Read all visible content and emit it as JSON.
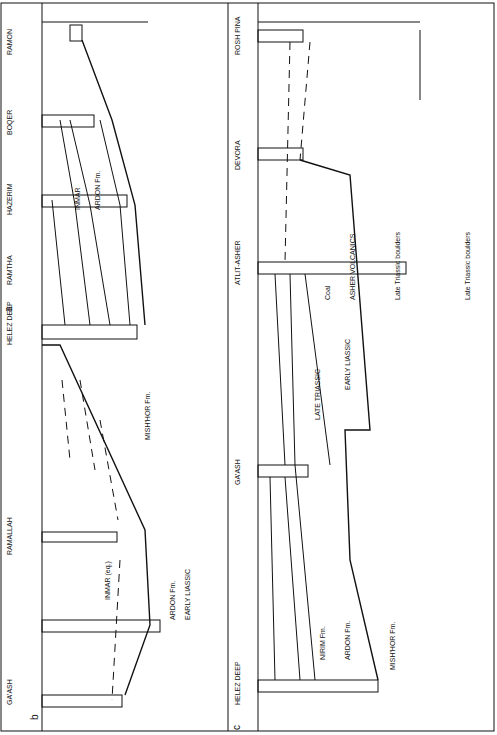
{
  "figure": {
    "panels": [
      {
        "id": "a",
        "label": "a",
        "wells": [
          "RAMON",
          "BOQER",
          "HAZERIM",
          "HELEZ DEEP"
        ],
        "depth_scale": {
          "unit": "m",
          "ticks": [
            "500",
            "1000",
            "1500"
          ]
        },
        "units": [
          "SST",
          "INMAR",
          "ARDON",
          "MOHILLA Fm.",
          "LIASSIC",
          "TRIASSIC LATE",
          "DOM",
          "GEREN Fm.",
          "Q. praecursor",
          "INMAR",
          "ARDON Fm.",
          "MISH'HOR Fm.",
          "AAL",
          "TOAR",
          "DOM",
          "NIRIM Fm.",
          "ARDON Fm.",
          "SHARON Fm.",
          "NOR"
        ]
      },
      {
        "id": "b",
        "label": "b",
        "wells": [
          "RAMTHA",
          "RAMALLAH",
          "GA'ASH"
        ],
        "units": [
          "SST",
          "MISH'HOR Fm.",
          "INMAR (eq.)",
          "Q. praecursor",
          "GEREN (eq.)",
          "ARDON Fm.",
          "EARLY LIASSIC",
          "MISH'HOR Fm.",
          "AAL",
          "TOAR",
          "DOM",
          "NOR.",
          "NOR."
        ],
        "stratigraphy": [
          "MIDDLE JURASSIC",
          "MIDDLE LATE LIASSIC",
          "TRIASSIC"
        ]
      },
      {
        "id": "c",
        "label": "c",
        "wells": [
          "ROSH PINA",
          "DEVORA",
          "ATLIT-ASHER",
          "GA'ASH",
          "HELEZ DEEP"
        ],
        "depth_scale": {
          "unit": "m",
          "ticks": [
            "500",
            "1000",
            "1500"
          ]
        },
        "horizontal_scale": {
          "start": "0",
          "end": "25 km"
        },
        "units": [
          "MIDDLE LATE",
          "LIASSIC",
          "NOR",
          "Coal",
          "ASHER VOLCANICS",
          "Late Triassic boulders",
          "Late Triassic boulders",
          "BAJ",
          "AAL",
          "TOAR",
          "DOM",
          "LIASSIC",
          "EARLY LIASSIC",
          "LATE TRIASSIC",
          "AAL",
          "TOAR",
          "DOM",
          "NIRIM Fm.",
          "ARDON Fm.",
          "MISH'HOR Fm.",
          "AAL",
          "TOAR",
          "DOM",
          "NOR"
        ],
        "stratigraphy": [
          "LATE",
          "MIDDLE",
          "EARLY",
          "LIASSIC",
          "TRIASSIC LATE"
        ]
      }
    ]
  }
}
